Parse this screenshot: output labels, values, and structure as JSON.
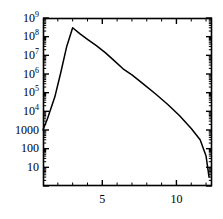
{
  "chart_data": {
    "type": "line",
    "title": "",
    "subtitle": "",
    "xlabel": "",
    "ylabel": "",
    "yscale": "log",
    "xscale": "linear",
    "xlim": [
      1,
      12.4
    ],
    "ylim": [
      1,
      1000000000
    ],
    "grid": false,
    "legend": null,
    "x_tick_labels": [
      "5",
      "10"
    ],
    "x_tick_values": [
      5,
      10
    ],
    "x_minor_tick_values": [
      2,
      3,
      4,
      6,
      7,
      8,
      9,
      11,
      12
    ],
    "y_tick_labels": [
      "10",
      "100",
      "1000",
      "10⁴",
      "10⁵",
      "10⁶",
      "10⁷",
      "10⁸",
      "10⁹"
    ],
    "y_tick_values": [
      10,
      100,
      1000,
      10000,
      100000,
      1000000,
      10000000,
      100000000,
      1000000000
    ],
    "series": [
      {
        "name": "curve",
        "x": [
          1.0,
          1.3,
          1.8,
          2.2,
          2.6,
          3.0,
          3.5,
          4.0,
          4.6,
          5.2,
          5.8,
          6.4,
          7.0,
          7.8,
          8.6,
          9.4,
          10.2,
          11.0,
          11.6,
          12.0,
          12.2
        ],
        "y": [
          1000,
          4000,
          60000,
          1200000,
          30000000,
          300000000,
          140000000,
          72000000,
          33000000,
          14000000,
          5200000,
          1900000,
          900000,
          280000,
          85000,
          24000,
          6000,
          1200,
          300,
          40,
          3
        ]
      }
    ]
  },
  "axes": {
    "frame": {
      "left": 43,
      "right": 212,
      "top": 18,
      "bottom": 186
    },
    "line_color": "#000000",
    "curve_color": "#000000"
  }
}
